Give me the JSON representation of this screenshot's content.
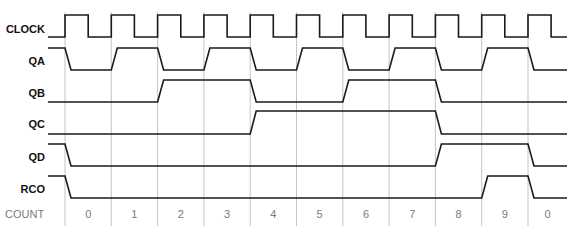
{
  "diagram": {
    "colors": {
      "signal": "#1a1a1a",
      "gridline": "#bdbdbd",
      "label": "#111111",
      "count_text": "#7a7a7a",
      "background": "#ffffff"
    },
    "layout": {
      "grid_x": [
        65,
        111.3,
        157.6,
        203.9,
        250.2,
        296.5,
        342.8,
        389.1,
        435.4,
        481.7,
        528
      ],
      "x_start": 5,
      "x_end": 567,
      "signal_start_x": 48,
      "grid_top": 12,
      "grid_bottom": 226,
      "slope": 6,
      "label_right_x": 45,
      "count_text_y": 218
    },
    "signals": [
      {
        "name": "CLOCK",
        "label_y": 29,
        "high_y": 15,
        "low_y": 37,
        "type": "clock",
        "initial": 0,
        "levels": [
          1,
          1,
          1,
          1,
          1,
          1,
          1,
          1,
          1,
          1,
          1
        ]
      },
      {
        "name": "QA",
        "label_y": 61,
        "high_y": 48,
        "low_y": 70,
        "type": "data",
        "initial": 1,
        "levels": [
          0,
          1,
          0,
          1,
          0,
          1,
          0,
          1,
          0,
          1,
          0
        ]
      },
      {
        "name": "QB",
        "label_y": 93,
        "high_y": 80,
        "low_y": 102,
        "type": "data",
        "initial": 0,
        "levels": [
          0,
          0,
          1,
          1,
          0,
          0,
          1,
          1,
          0,
          0,
          0
        ]
      },
      {
        "name": "QC",
        "label_y": 124,
        "high_y": 111,
        "low_y": 134,
        "type": "data",
        "initial": 0,
        "levels": [
          0,
          0,
          0,
          0,
          1,
          1,
          1,
          1,
          0,
          0,
          0
        ]
      },
      {
        "name": "QD",
        "label_y": 157,
        "high_y": 144,
        "low_y": 166,
        "type": "data",
        "initial": 1,
        "levels": [
          0,
          0,
          0,
          0,
          0,
          0,
          0,
          0,
          1,
          1,
          0
        ]
      },
      {
        "name": "RCO",
        "label_y": 189,
        "high_y": 176,
        "low_y": 198,
        "type": "data",
        "initial": 1,
        "levels": [
          0,
          0,
          0,
          0,
          0,
          0,
          0,
          0,
          0,
          1,
          0
        ]
      }
    ],
    "count": {
      "label": "COUNT",
      "values": [
        "0",
        "1",
        "2",
        "3",
        "4",
        "5",
        "6",
        "7",
        "8",
        "9",
        "0"
      ]
    }
  }
}
